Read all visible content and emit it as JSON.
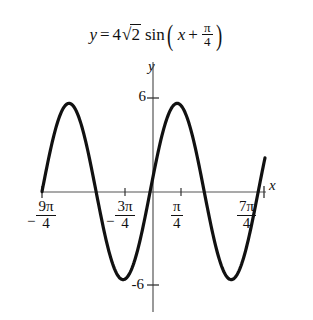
{
  "figure": {
    "title_equation": {
      "lhs": "y",
      "equals": "=",
      "coefficient": "4",
      "radical_sign": "√",
      "radicand": "2",
      "function": "sin",
      "open_paren": "(",
      "argument_variable": "x",
      "plus": "+",
      "argument_fraction_numerator": "π",
      "argument_fraction_denominator": "4",
      "close_paren": ")",
      "plain": "y = 4√2 sin(x + π/4)"
    },
    "axes": {
      "y_axis_label": "y",
      "x_axis_label": "x",
      "y_tick_top": "6",
      "y_tick_bottom": "-6",
      "x_tick_labels": [
        {
          "sign": "−",
          "numerator": "9π",
          "denominator": "4",
          "plain": "-9π/4"
        },
        {
          "sign": "−",
          "numerator": "3π",
          "denominator": "4",
          "plain": "-3π/4"
        },
        {
          "sign": "",
          "numerator": "π",
          "denominator": "4",
          "plain": "π/4"
        },
        {
          "sign": "",
          "numerator": "7π",
          "denominator": "4",
          "plain": "7π/4"
        }
      ]
    },
    "colors": {
      "curve": "#111111",
      "axis": "#555555",
      "background": "#ffffff",
      "text": "#111111"
    }
  },
  "chart_data": {
    "type": "line",
    "xlabel": "x",
    "ylabel": "y",
    "function": "y = 4*sqrt(2)*sin(x + pi/4)",
    "amplitude": 5.657,
    "period": 6.283,
    "phase_shift": -0.785,
    "xlim": [
      -7.069,
      5.89
    ],
    "ylim": [
      -6.6,
      6.6
    ],
    "grid": false,
    "legend": null,
    "x_ticks": [
      -7.069,
      -2.356,
      0.785,
      5.498
    ],
    "x_tick_labels": [
      "-9π/4",
      "-3π/4",
      "π/4",
      "7π/4"
    ],
    "y_ticks": [
      -6,
      6
    ],
    "y_tick_labels": [
      "-6",
      "6"
    ],
    "key_points": [
      {
        "x": -7.069,
        "y": 0,
        "kind": "zero-rising"
      },
      {
        "x": -5.498,
        "y": 5.657,
        "kind": "maximum"
      },
      {
        "x": -3.927,
        "y": 0,
        "kind": "zero-falling"
      },
      {
        "x": -2.356,
        "y": -5.657,
        "kind": "minimum"
      },
      {
        "x": -0.785,
        "y": 0,
        "kind": "zero-rising"
      },
      {
        "x": 0.785,
        "y": 5.657,
        "kind": "maximum"
      },
      {
        "x": 2.356,
        "y": 0,
        "kind": "zero-falling"
      },
      {
        "x": 3.927,
        "y": -5.657,
        "kind": "minimum"
      },
      {
        "x": 5.498,
        "y": 0,
        "kind": "zero-rising"
      }
    ]
  }
}
